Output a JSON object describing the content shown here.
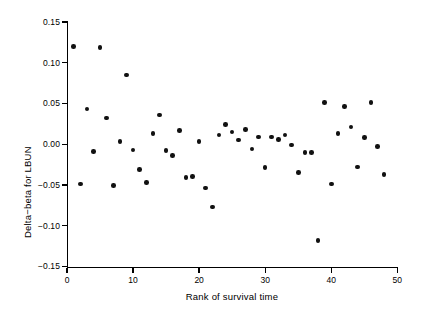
{
  "chart_data": {
    "type": "scatter",
    "title": "",
    "xlabel": "Rank of survival time",
    "ylabel": "Delta−beta for LBUN",
    "xlim": [
      0,
      50
    ],
    "ylim": [
      -0.15,
      0.15
    ],
    "xticks": [
      0,
      10,
      20,
      30,
      40,
      50
    ],
    "xtick_labels": [
      "0",
      "10",
      "20",
      "30",
      "40",
      "50"
    ],
    "yticks": [
      0.15,
      0.1,
      0.05,
      0.0,
      -0.05,
      -0.1,
      -0.15
    ],
    "ytick_labels": [
      "0.15",
      "0.10",
      "0.05",
      "0.00",
      "−0.05",
      "−0.10",
      "−0.15"
    ],
    "grid": false,
    "legend": null,
    "marker": "filled-circle",
    "marker_color": "#111111",
    "marker_size_px": 4.6,
    "n_points": 48,
    "x": [
      1,
      2,
      3,
      4,
      5,
      6,
      7,
      8,
      9,
      10,
      11,
      12,
      13,
      14,
      15,
      16,
      17,
      18,
      19,
      20,
      21,
      22,
      23,
      24,
      25,
      26,
      27,
      28,
      29,
      30,
      31,
      32,
      33,
      34,
      35,
      36,
      37,
      38,
      39,
      40,
      41,
      42,
      43,
      44,
      45,
      46,
      47,
      48
    ],
    "y": [
      0.12,
      -0.049,
      0.043,
      -0.009,
      0.119,
      0.032,
      -0.051,
      0.003,
      0.085,
      -0.007,
      -0.031,
      -0.047,
      0.013,
      0.036,
      -0.008,
      -0.014,
      0.017,
      -0.041,
      -0.04,
      0.003,
      -0.054,
      -0.077,
      0.011,
      0.024,
      0.015,
      0.005,
      0.018,
      -0.006,
      0.009,
      -0.029,
      0.009,
      0.006,
      0.011,
      -0.001,
      -0.035,
      -0.01,
      -0.01,
      -0.118,
      0.051,
      -0.049,
      0.013,
      0.046,
      0.021,
      -0.028,
      0.008,
      0.051,
      -0.003,
      -0.037
    ]
  },
  "axes": {
    "y_axis_name": "y-axis",
    "x_axis_name": "x-axis"
  }
}
